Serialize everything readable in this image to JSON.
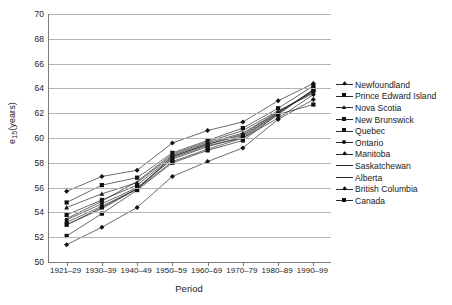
{
  "chart_data": {
    "type": "line",
    "title": "",
    "xlabel": "Period",
    "ylabel": "e15(years)",
    "ylabel_base": "e",
    "ylabel_sub": "15",
    "ylabel_suffix": "(years)",
    "categories": [
      "1921–29",
      "1930–39",
      "1940–49",
      "1950–59",
      "1960–69",
      "1970–79",
      "1980–89",
      "1990–99"
    ],
    "yticks": [
      50,
      52,
      54,
      56,
      58,
      60,
      62,
      64,
      66,
      68,
      70
    ],
    "ylim": [
      50,
      70
    ],
    "grid": true,
    "legend_position": "right",
    "line_color": "#2b2b2b",
    "marker_color": "#111111",
    "grid_color": "#b4b4b4",
    "axis_color": "#7a7a7a",
    "series": [
      {
        "name": "Newfoundland",
        "marker": "diamond",
        "values": [
          55.7,
          56.9,
          57.4,
          59.6,
          60.6,
          61.3,
          63.0,
          64.4
        ]
      },
      {
        "name": "Prince Edward Island",
        "marker": "square",
        "values": [
          54.8,
          56.2,
          56.8,
          58.8,
          59.8,
          60.8,
          62.4,
          64.2
        ]
      },
      {
        "name": "Nova Scotia",
        "marker": "tri",
        "values": [
          54.4,
          55.5,
          56.4,
          58.6,
          59.6,
          60.4,
          62.1,
          63.8
        ]
      },
      {
        "name": "New Brunswick",
        "marker": "square",
        "values": [
          53.8,
          55.0,
          56.2,
          58.5,
          59.5,
          60.2,
          62.0,
          63.9
        ]
      },
      {
        "name": "Quebec",
        "marker": "square",
        "values": [
          52.1,
          53.9,
          55.8,
          58.0,
          59.0,
          59.8,
          61.9,
          63.9
        ]
      },
      {
        "name": "Ontario",
        "marker": "circle",
        "values": [
          53.4,
          54.7,
          56.0,
          58.3,
          59.3,
          60.1,
          62.0,
          63.8
        ]
      },
      {
        "name": "Manitoba",
        "marker": "diamond",
        "values": [
          53.2,
          54.5,
          55.9,
          58.4,
          59.4,
          60.0,
          61.6,
          63.5
        ]
      },
      {
        "name": "Saskatchewan",
        "marker": "none",
        "values": [
          53.5,
          54.9,
          56.5,
          58.7,
          59.7,
          60.6,
          62.2,
          63.6
        ]
      },
      {
        "name": "Alberta",
        "marker": "none",
        "values": [
          53.0,
          54.3,
          55.9,
          58.5,
          59.5,
          60.3,
          62.1,
          63.7
        ]
      },
      {
        "name": "British Columbia",
        "marker": "diamond",
        "values": [
          51.4,
          52.8,
          54.4,
          56.9,
          58.1,
          59.2,
          61.5,
          63.1
        ]
      },
      {
        "name": "Canada",
        "marker": "square",
        "values": [
          53.0,
          54.4,
          55.9,
          58.1,
          59.1,
          60.0,
          61.9,
          62.7
        ]
      }
    ]
  }
}
